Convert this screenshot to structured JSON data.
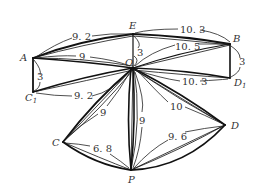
{
  "diagram": {
    "type": "geometry-net-unfolding",
    "points": {
      "E": {
        "label": "E",
        "sub": ""
      },
      "B": {
        "label": "B",
        "sub": ""
      },
      "A": {
        "label": "A",
        "sub": ""
      },
      "O": {
        "label": "O",
        "sub": ""
      },
      "C1": {
        "label": "C",
        "sub": "1"
      },
      "D1": {
        "label": "D",
        "sub": "1"
      },
      "C": {
        "label": "C",
        "sub": ""
      },
      "D": {
        "label": "D",
        "sub": ""
      },
      "P": {
        "label": "P",
        "sub": ""
      }
    },
    "lengths": {
      "AE": "9. 2",
      "EB": "10. 3",
      "AO": "9",
      "OB": "10. 5",
      "EO": "3",
      "AC1": "3",
      "BD1": "3",
      "C1O": "9. 2",
      "OD1": "10. 3",
      "OC": "9",
      "OP": "9",
      "OD": "10",
      "CP": "6. 8",
      "DP": "9. 6"
    }
  }
}
